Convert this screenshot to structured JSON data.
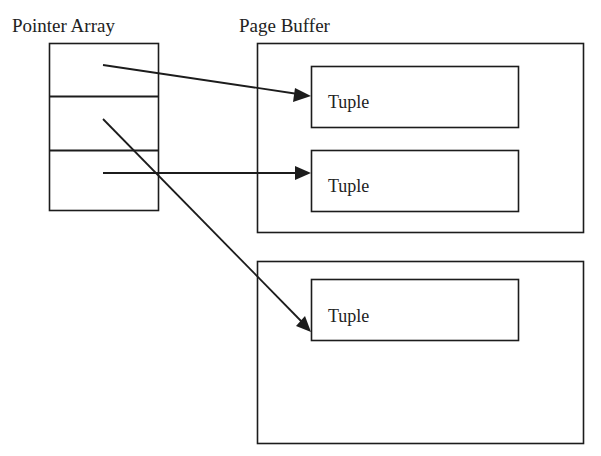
{
  "diagram": {
    "pointer_array": {
      "label": "Pointer Array",
      "slots": 3
    },
    "page_buffers": [
      {
        "label": "Page Buffer",
        "tuples": [
          {
            "label": "Tuple"
          },
          {
            "label": "Tuple"
          }
        ]
      },
      {
        "label": "",
        "tuples": [
          {
            "label": "Tuple"
          }
        ]
      }
    ],
    "pointers": [
      {
        "from_slot": 1,
        "to": "page buffer 1, tuple 1"
      },
      {
        "from_slot": 2,
        "to": "page buffer 2, tuple 1"
      },
      {
        "from_slot": 3,
        "to": "page buffer 1, tuple 2"
      }
    ],
    "colors": {
      "stroke": "#1c1c1c",
      "text": "#222222",
      "background": "#ffffff"
    }
  }
}
